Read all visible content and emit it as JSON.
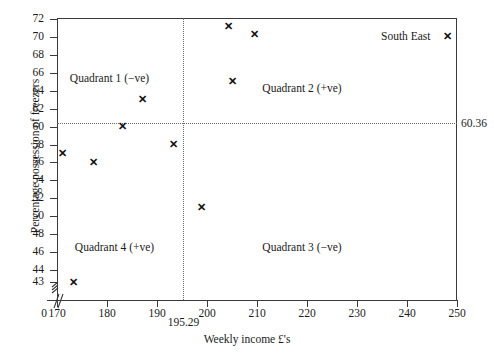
{
  "chart_data": {
    "type": "scatter",
    "title": "",
    "xlabel": "Weekly income £'s",
    "ylabel": "Percentage possession of freezers",
    "xlim": [
      170,
      250
    ],
    "ylim": [
      43,
      72
    ],
    "grid": false,
    "legend": "none",
    "xticks": [
      170,
      180,
      190,
      200,
      210,
      220,
      230,
      240,
      250
    ],
    "yticks": [
      43,
      44,
      46,
      48,
      50,
      52,
      54,
      56,
      58,
      60,
      62,
      64,
      66,
      68,
      70,
      72
    ],
    "axis_break_x": "0",
    "axis_break_y": "0",
    "origin_label": "0",
    "reference_lines": {
      "vertical": {
        "value": 195.29,
        "label": "195.29",
        "style": "dotted"
      },
      "horizontal": {
        "value": 60.36,
        "label": "60.36",
        "style": "dotted"
      }
    },
    "points": [
      {
        "x": 171.0,
        "y": 57.0,
        "label": ""
      },
      {
        "x": 173.3,
        "y": 43.0,
        "label": ""
      },
      {
        "x": 177.2,
        "y": 56.0,
        "label": ""
      },
      {
        "x": 183.0,
        "y": 60.0,
        "label": ""
      },
      {
        "x": 187.0,
        "y": 63.0,
        "label": ""
      },
      {
        "x": 193.2,
        "y": 58.0,
        "label": ""
      },
      {
        "x": 198.8,
        "y": 51.0,
        "label": ""
      },
      {
        "x": 204.3,
        "y": 71.2,
        "label": ""
      },
      {
        "x": 205.0,
        "y": 65.0,
        "label": ""
      },
      {
        "x": 209.4,
        "y": 70.3,
        "label": ""
      },
      {
        "x": 248.0,
        "y": 70.0,
        "label": "South East"
      }
    ],
    "annotations": [
      {
        "text": "Quadrant 1 (−ve)",
        "x": 180.5,
        "y": 65.3
      },
      {
        "text": "Quadrant 2 (+ve)",
        "x": 219.0,
        "y": 64.2
      },
      {
        "text": "Quadrant 3 (−ve)",
        "x": 219.0,
        "y": 46.4
      },
      {
        "text": "Quadrant 4 (+ve)",
        "x": 181.5,
        "y": 46.4
      }
    ],
    "marker_glyph": "cross-marker",
    "marker_color": "#111111",
    "axis_color": "#3a3a3a",
    "reference_line_color": "#6a6a6a"
  }
}
